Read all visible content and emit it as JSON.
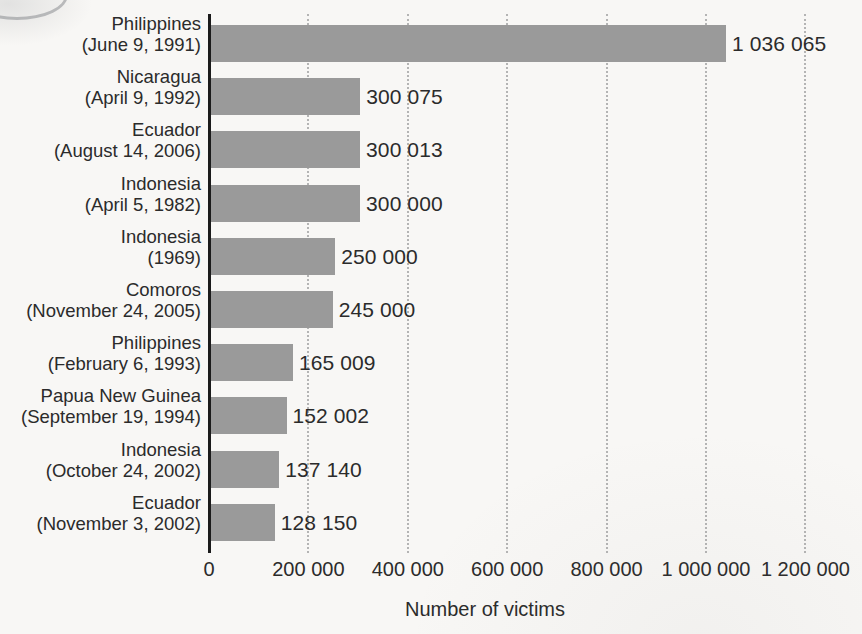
{
  "chart_data": {
    "type": "bar",
    "orientation": "horizontal",
    "title": "",
    "xlabel": "Number of victims",
    "ylabel": "",
    "xlim": [
      0,
      1300000
    ],
    "grid": "vertical-dotted",
    "legend": "none",
    "categories": [
      "Philippines (June 9, 1991)",
      "Nicaragua (April 9, 1992)",
      "Ecuador (August 14, 2006)",
      "Indonesia (April 5, 1982)",
      "Indonesia (1969)",
      "Comoros (November 24, 2005)",
      "Philippines (February 6, 1993)",
      "Papua New Guinea (September 19, 1994)",
      "Indonesia (October 24, 2002)",
      "Ecuador (November 3, 2002)"
    ],
    "values": [
      1036065,
      300075,
      300013,
      300000,
      250000,
      245000,
      165009,
      152002,
      137140,
      128150
    ],
    "value_labels": [
      "1 036 065",
      "300 075",
      "300 013",
      "300 000",
      "250 000",
      "245 000",
      "165 009",
      "152 002",
      "137 140",
      "128 150"
    ],
    "xticks": [
      0,
      200000,
      400000,
      600000,
      800000,
      1000000,
      1200000
    ],
    "xtick_labels": [
      "0",
      "200 000",
      "400 000",
      "600 000",
      "800 000",
      "1 000 000",
      "1 200 000"
    ],
    "bar_color": "#9a9a9a",
    "background_color": "#f8f7f5",
    "gridline_color": "#b4b4b4",
    "axis_color": "#1b1b1b",
    "text_color": "#2b2b2b"
  },
  "rows": [
    {
      "country": "Philippines",
      "date": "(June 9, 1991)",
      "value_label": "1 036 065"
    },
    {
      "country": "Nicaragua",
      "date": "(April 9, 1992)",
      "value_label": "300 075"
    },
    {
      "country": "Ecuador",
      "date": "(August 14, 2006)",
      "value_label": "300 013"
    },
    {
      "country": "Indonesia",
      "date": "(April 5, 1982)",
      "value_label": "300 000"
    },
    {
      "country": "Indonesia",
      "date": "(1969)",
      "value_label": "250 000"
    },
    {
      "country": "Comoros",
      "date": "(November 24, 2005)",
      "value_label": "245 000"
    },
    {
      "country": "Philippines",
      "date": "(February 6, 1993)",
      "value_label": "165 009"
    },
    {
      "country": "Papua New Guinea",
      "date": "(September 19, 1994)",
      "value_label": "152 002"
    },
    {
      "country": "Indonesia",
      "date": "(October 24, 2002)",
      "value_label": "137 140"
    },
    {
      "country": "Ecuador",
      "date": "(November 3, 2002)",
      "value_label": "128 150"
    }
  ],
  "axis": {
    "title": "Number of victims",
    "ticks": [
      "0",
      "200 000",
      "400 000",
      "600 000",
      "800 000",
      "1 000 000",
      "1 200 000"
    ]
  }
}
